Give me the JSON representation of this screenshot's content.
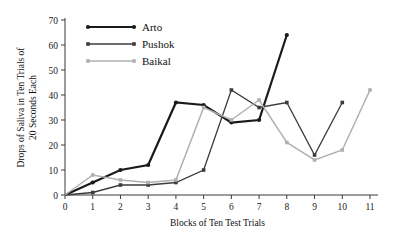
{
  "chart_data": {
    "type": "line",
    "title": "",
    "xlabel": "Blocks of Ten Test Trials",
    "ylabel": "Drops of Saliva in Ten Trials of 20 Seconds Each",
    "ylabel_line1": "Drops of Saliva in Ten Trials of",
    "ylabel_line2": "20 Seconds Each",
    "x": [
      0,
      1,
      2,
      3,
      4,
      5,
      6,
      7,
      8,
      9,
      10,
      11
    ],
    "xlim": [
      0,
      11
    ],
    "ylim": [
      0,
      70
    ],
    "xticks": [
      "0",
      "1",
      "2",
      "3",
      "4",
      "5",
      "6",
      "7",
      "8",
      "9",
      "10",
      "11"
    ],
    "yticks": [
      "0",
      "10",
      "20",
      "30",
      "40",
      "50",
      "60",
      "70"
    ],
    "grid": false,
    "legend_position": "top-left",
    "series": [
      {
        "name": "Arto",
        "color": "#1a1a1a",
        "width": 2.2,
        "marker": "circle",
        "x": [
          0,
          1,
          2,
          3,
          4,
          5,
          6,
          7,
          8
        ],
        "values": [
          0,
          5,
          10,
          12,
          37,
          36,
          29,
          30,
          64
        ]
      },
      {
        "name": "Pushok",
        "color": "#3c3c3c",
        "width": 1.3,
        "marker": "square",
        "x": [
          0,
          1,
          2,
          3,
          4,
          5,
          6,
          7,
          8,
          9,
          10
        ],
        "values": [
          0,
          1,
          4,
          4,
          5,
          10,
          42,
          35,
          37,
          16,
          37
        ]
      },
      {
        "name": "Baikal",
        "color": "#b0b0b0",
        "width": 1.5,
        "marker": "square",
        "x": [
          0,
          1,
          2,
          3,
          4,
          5,
          6,
          7,
          8,
          9,
          10,
          11
        ],
        "values": [
          0,
          8,
          6,
          5,
          6,
          35,
          30,
          38,
          21,
          14,
          18,
          42
        ]
      }
    ]
  },
  "legend": {
    "items": [
      {
        "label": "Arto"
      },
      {
        "label": "Pushok"
      },
      {
        "label": "Baikal"
      }
    ]
  }
}
